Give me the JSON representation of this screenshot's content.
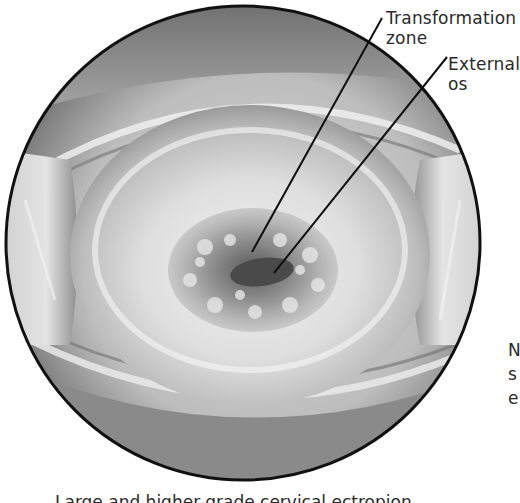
{
  "figure": {
    "style": "grayscale medical illustration",
    "frame": {
      "shape": "circle",
      "center": [
        243,
        243
      ],
      "radius": 237,
      "stroke": "#111111"
    }
  },
  "labels": {
    "transformation_zone": {
      "line1": "Transformation",
      "line2": "zone",
      "leader_from": [
        382,
        18
      ],
      "leader_to": [
        252,
        252
      ]
    },
    "external_os": {
      "line1": "External",
      "line2": "os",
      "leader_from": [
        447,
        57
      ],
      "leader_to": [
        274,
        273
      ]
    },
    "side_text_cut": {
      "line1": "N",
      "line2": "s",
      "line3": "e"
    }
  },
  "caption_cut": "Large and higher-grade cervical ectropion"
}
